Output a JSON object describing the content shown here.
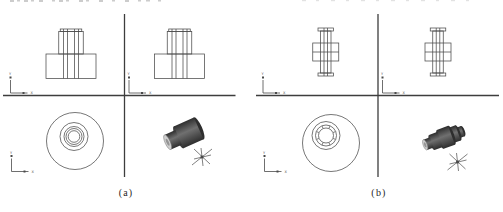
{
  "colors": {
    "background": "#ffffff",
    "line": "#4a4a4a",
    "divider": "#3d3d3d",
    "caption": "#1f1f1f",
    "solid_dark": "#2e2e2e",
    "solid_mid": "#707070",
    "solid_face": "#cfcfcf",
    "fragment": "#9a9a9a"
  },
  "ucs_icon": {
    "x_label": "X",
    "y_label": "Y"
  },
  "panels": [
    {
      "caption": "(a)"
    },
    {
      "caption": "(b)"
    }
  ]
}
